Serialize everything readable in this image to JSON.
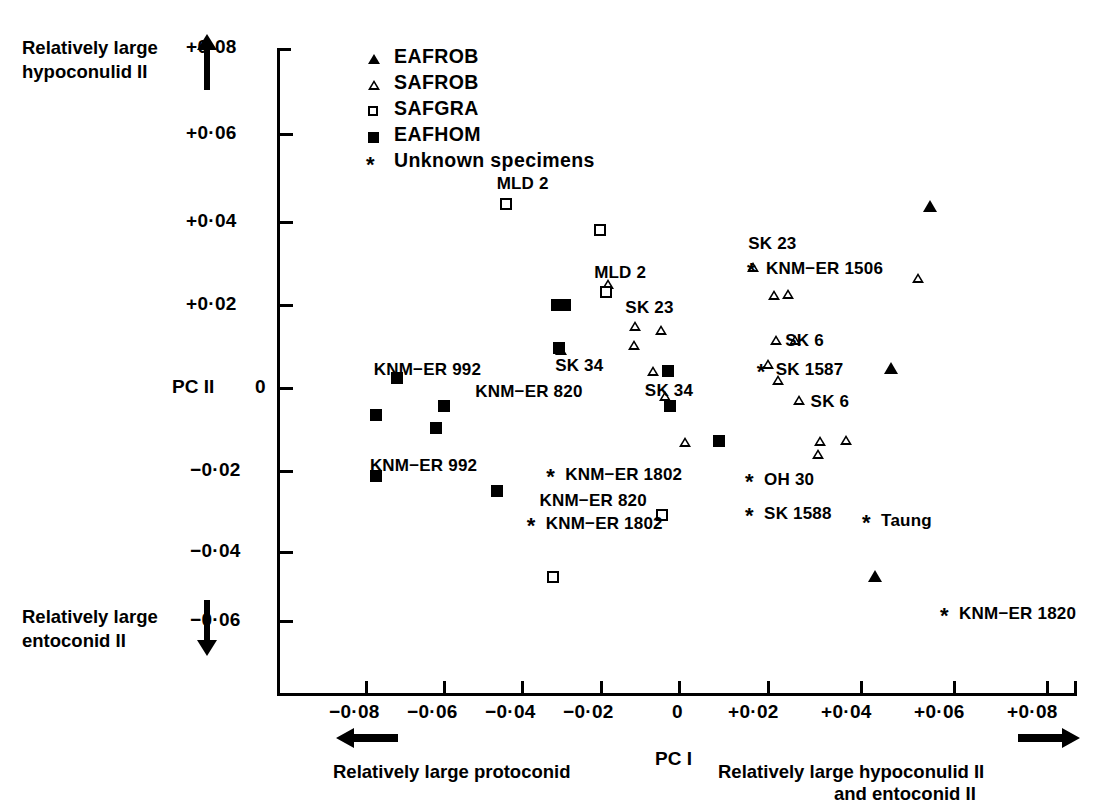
{
  "figure": {
    "axes": {
      "x_axis_name": "PC I",
      "y_axis_name": "PC II",
      "x_ticks": [
        "−0·08",
        "−0·06",
        "−0·04",
        "−0·02",
        "0",
        "+0·02",
        "+0·04",
        "+0·06",
        "+0·08"
      ],
      "y_ticks": [
        "+0·08",
        "+0·06",
        "+0·04",
        "+0·02",
        "0",
        "−0·02",
        "−0·04",
        "−0·06"
      ]
    },
    "annotations": {
      "top_left_line1": "Relatively large",
      "top_left_line2": "hypoconulid II",
      "bottom_left_line1": "Relatively large",
      "bottom_left_line2": "entoconid II",
      "bottom_left_axis": "Relatively large protoconid",
      "bottom_right_line1": "Relatively large hypoconulid II",
      "bottom_right_line2": "and entoconid II"
    },
    "legend": [
      {
        "marker": "filled-triangle",
        "label": "EAFROB"
      },
      {
        "marker": "open-triangle",
        "label": "SAFROB"
      },
      {
        "marker": "open-square",
        "label": "SAFGRA"
      },
      {
        "marker": "filled-square",
        "label": "EAFHOM"
      },
      {
        "marker": "asterisk",
        "label": "Unknown specimens"
      }
    ]
  },
  "chart_data": {
    "type": "scatter",
    "title": "",
    "xlabel": "PC I",
    "ylabel": "PC II",
    "xlim": [
      -0.09,
      0.0875
    ],
    "ylim": [
      -0.068,
      0.085
    ],
    "grid": false,
    "legend_position": "top-left-inside",
    "series": [
      {
        "name": "EAFROB",
        "marker": "filled-triangle",
        "points": [
          {
            "x": 0.0645,
            "y": 0.0435
          },
          {
            "x": 0.0545,
            "y": 0.0045
          },
          {
            "x": 0.0505,
            "y": -0.0455
          }
        ]
      },
      {
        "name": "SAFROB",
        "marker": "open-triangle",
        "points": [
          {
            "x": -0.03,
            "y": 0.0088
          },
          {
            "x": -0.018,
            "y": 0.0248
          },
          {
            "x": -0.011,
            "y": 0.0148
          },
          {
            "x": -0.0113,
            "y": 0.0102
          },
          {
            "x": -0.0043,
            "y": 0.0138
          },
          {
            "x": -0.0063,
            "y": 0.0038
          },
          {
            "x": -0.0033,
            "y": -0.0022
          },
          {
            "x": 0.0018,
            "y": -0.0132
          },
          {
            "x": 0.0193,
            "y": 0.029
          },
          {
            "x": 0.0283,
            "y": 0.0225
          },
          {
            "x": 0.0245,
            "y": 0.0222
          },
          {
            "x": 0.0252,
            "y": 0.0114
          },
          {
            "x": 0.03,
            "y": 0.0113
          },
          {
            "x": 0.0232,
            "y": 0.0056
          },
          {
            "x": 0.0256,
            "y": 0.0017
          },
          {
            "x": 0.031,
            "y": -0.0032
          },
          {
            "x": 0.0363,
            "y": -0.013
          },
          {
            "x": 0.036,
            "y": -0.0162
          },
          {
            "x": 0.0615,
            "y": 0.0262
          },
          {
            "x": 0.043,
            "y": -0.0128
          }
        ]
      },
      {
        "name": "SAFGRA",
        "marker": "open-square",
        "points": [
          {
            "x": -0.044,
            "y": 0.044
          },
          {
            "x": -0.02,
            "y": 0.0378
          },
          {
            "x": -0.0185,
            "y": 0.023
          },
          {
            "x": -0.004,
            "y": -0.0308
          },
          {
            "x": -0.032,
            "y": -0.0458
          }
        ]
      },
      {
        "name": "EAFHOM",
        "marker": "filled-square",
        "points": [
          {
            "x": -0.031,
            "y": 0.0198
          },
          {
            "x": -0.029,
            "y": 0.0198
          },
          {
            "x": -0.0305,
            "y": 0.0095
          },
          {
            "x": -0.072,
            "y": 0.0022
          },
          {
            "x": -0.0775,
            "y": -0.0068
          },
          {
            "x": -0.06,
            "y": -0.0045
          },
          {
            "x": -0.062,
            "y": -0.0098
          },
          {
            "x": -0.0775,
            "y": -0.0215
          },
          {
            "x": -0.0465,
            "y": -0.025
          },
          {
            "x": -0.002,
            "y": -0.0045
          },
          {
            "x": -0.0025,
            "y": 0.0038
          },
          {
            "x": 0.0105,
            "y": -0.013
          }
        ]
      },
      {
        "name": "Unknown specimens",
        "marker": "asterisk",
        "points": [
          {
            "x": -0.032,
            "y": -0.0212,
            "label": "KNM−ER 1802"
          },
          {
            "x": -0.037,
            "y": -0.033,
            "label": "KNM−ER 1802"
          },
          {
            "x": 0.0195,
            "y": 0.0285,
            "label": "KNM−ER 1506"
          },
          {
            "x": 0.022,
            "y": 0.004,
            "label": "SK 1587"
          },
          {
            "x": 0.019,
            "y": -0.0225,
            "label": "OH 30"
          },
          {
            "x": 0.019,
            "y": -0.0305,
            "label": "SK 1588"
          },
          {
            "x": 0.049,
            "y": -0.0322,
            "label": "Taung"
          },
          {
            "x": 0.069,
            "y": -0.0548,
            "label": "KNM−ER 1820"
          }
        ]
      }
    ],
    "point_labels": [
      {
        "text": "MLD 2",
        "x": -0.0465,
        "y": 0.049
      },
      {
        "text": "MLD 2",
        "x": -0.0215,
        "y": 0.0275
      },
      {
        "text": "SK 23",
        "x": -0.0135,
        "y": 0.019
      },
      {
        "text": "SK 23",
        "x": 0.018,
        "y": 0.0345
      },
      {
        "text": "SK 34",
        "x": -0.0315,
        "y": 0.005
      },
      {
        "text": "SK 34",
        "x": -0.0085,
        "y": -0.001
      },
      {
        "text": "SK 6",
        "x": 0.0275,
        "y": 0.0112
      },
      {
        "text": "SK 6",
        "x": 0.034,
        "y": -0.0035
      },
      {
        "text": "KNM−ER 992",
        "x": -0.078,
        "y": 0.004
      },
      {
        "text": "KNM−ER 992",
        "x": -0.079,
        "y": -0.019
      },
      {
        "text": "KNM−ER 820",
        "x": -0.052,
        "y": -0.0012
      },
      {
        "text": "KNM−ER 820",
        "x": -0.0355,
        "y": -0.0275
      }
    ]
  }
}
